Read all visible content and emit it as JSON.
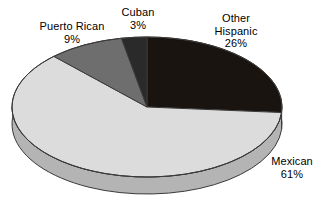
{
  "chart_data": {
    "type": "pie",
    "title": "",
    "subtitle": "",
    "xlabel": "",
    "ylabel": "",
    "legend_position": "none",
    "grid": false,
    "three_d": true,
    "start_angle_deg": 0,
    "direction": "clockwise",
    "units": "percent",
    "total": 99,
    "categories": [
      "Other Hispanic",
      "Mexican",
      "Puerto Rican",
      "Cuban"
    ],
    "values": [
      26,
      61,
      9,
      3
    ],
    "slices": [
      {
        "name": "other-hispanic",
        "label_line1": "Other",
        "label_line2": "Hispanic",
        "value_text": "26%",
        "value": 26,
        "color": "#1a1410",
        "side_color": "#15100d"
      },
      {
        "name": "mexican",
        "label_line1": "Mexican",
        "label_line2": "",
        "value_text": "61%",
        "value": 61,
        "color": "#dcdcdc",
        "side_color": "#b4b4b4"
      },
      {
        "name": "puerto-rican",
        "label_line1": "Puerto Rican",
        "label_line2": "",
        "value_text": "9%",
        "value": 9,
        "color": "#6e6e6e",
        "side_color": "#5a5a5a"
      },
      {
        "name": "cuban",
        "label_line1": "Cuban",
        "label_line2": "",
        "value_text": "3%",
        "value": 3,
        "color": "#2a2a2a",
        "side_color": "#222222"
      }
    ],
    "background_color": "#ffffff",
    "outline_color": "#000000"
  },
  "labels": {
    "puerto_rican": {
      "name": "Puerto Rican",
      "percent": "9%"
    },
    "cuban": {
      "name": "Cuban",
      "percent": "3%"
    },
    "other_hispanic": {
      "name_line1": "Other",
      "name_line2": "Hispanic",
      "percent": "26%"
    },
    "mexican": {
      "name": "Mexican",
      "percent": "61%"
    }
  }
}
